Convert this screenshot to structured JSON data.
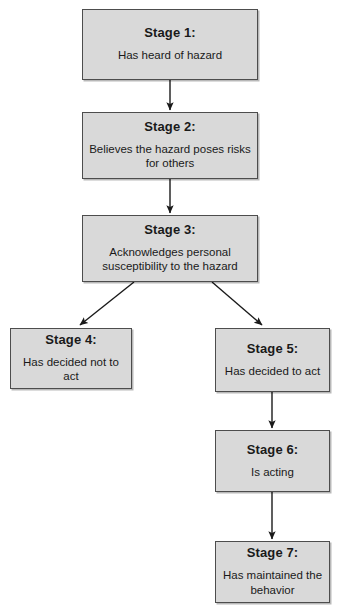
{
  "diagram": {
    "type": "flowchart",
    "orientation": "vertical-branching",
    "box_fill_color": "#d9d9d9",
    "box_border_color": "#4d4d4d",
    "arrow_color": "#1a1a1a",
    "background_color": "#ffffff",
    "stages": [
      {
        "id": "stage-1",
        "title": "Stage 1:",
        "description": "Has heard of hazard"
      },
      {
        "id": "stage-2",
        "title": "Stage 2:",
        "description": "Believes the hazard poses risks for others"
      },
      {
        "id": "stage-3",
        "title": "Stage 3:",
        "description": "Acknowledges personal susceptibility to the hazard"
      },
      {
        "id": "stage-4",
        "title": "Stage 4:",
        "description": "Has decided not to act"
      },
      {
        "id": "stage-5",
        "title": "Stage 5:",
        "description": "Has decided to act"
      },
      {
        "id": "stage-6",
        "title": "Stage 6:",
        "description": "Is acting"
      },
      {
        "id": "stage-7",
        "title": "Stage 7:",
        "description": "Has maintained the behavior"
      }
    ],
    "connectors": [
      {
        "id": "arrow-1-2",
        "from": "stage-1",
        "to": "stage-2",
        "style": "straight-vertical"
      },
      {
        "id": "arrow-2-3",
        "from": "stage-2",
        "to": "stage-3",
        "style": "straight-vertical"
      },
      {
        "id": "arrow-3-4",
        "from": "stage-3",
        "to": "stage-4",
        "style": "diagonal-left"
      },
      {
        "id": "arrow-3-5",
        "from": "stage-3",
        "to": "stage-5",
        "style": "diagonal-right"
      },
      {
        "id": "arrow-5-6",
        "from": "stage-5",
        "to": "stage-6",
        "style": "straight-vertical"
      },
      {
        "id": "arrow-6-7",
        "from": "stage-6",
        "to": "stage-7",
        "style": "straight-vertical"
      }
    ]
  }
}
